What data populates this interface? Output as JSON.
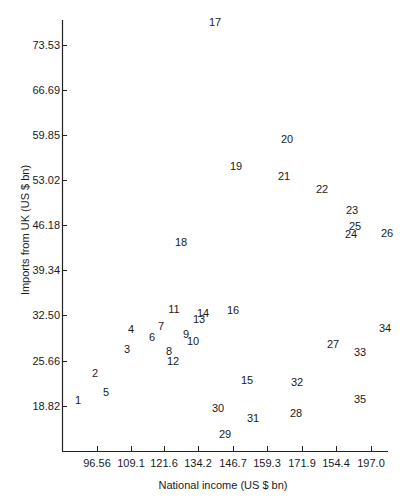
{
  "chart_data": {
    "type": "scatter",
    "title": "",
    "xlabel": "National income (US $ bn)",
    "ylabel": "Imports from UK (US $ bn)",
    "x_ticks": [
      "96.56",
      "109.1",
      "121.6",
      "134.2",
      "146.7",
      "159.3",
      "171.9",
      "154.4",
      "197.0"
    ],
    "y_ticks": [
      "73.53",
      "66.69",
      "59.85",
      "53.02",
      "46.18",
      "39.34",
      "32.50",
      "25.66",
      "18.82"
    ],
    "xlim": [
      84,
      200
    ],
    "ylim": [
      12,
      77
    ],
    "grid": false,
    "legend": "none",
    "marker": "numeric label",
    "points": [
      {
        "label": "1",
        "x": 87.5,
        "y": 19.6,
        "px": 78,
        "py": 400
      },
      {
        "label": "2",
        "x": 95.5,
        "y": 24.1,
        "px": 95,
        "py": 373
      },
      {
        "label": "3",
        "x": 106.5,
        "y": 28.1,
        "px": 127,
        "py": 349
      },
      {
        "label": "4",
        "x": 110.3,
        "y": 31.2,
        "px": 131,
        "py": 329
      },
      {
        "label": "5",
        "x": 100.5,
        "y": 21.5,
        "px": 106,
        "py": 392
      },
      {
        "label": "6",
        "x": 117.0,
        "y": 29.4,
        "px": 152,
        "py": 337
      },
      {
        "label": "7",
        "x": 120.5,
        "y": 31.4,
        "px": 161,
        "py": 326
      },
      {
        "label": "8",
        "x": 123.5,
        "y": 27.8,
        "px": 169,
        "py": 351
      },
      {
        "label": "9",
        "x": 129.5,
        "y": 30.0,
        "px": 186,
        "py": 334
      },
      {
        "label": "10",
        "x": 131.0,
        "y": 29.0,
        "px": 193,
        "py": 341
      },
      {
        "label": "11",
        "x": 124.5,
        "y": 34.0,
        "px": 174,
        "py": 309
      },
      {
        "label": "12",
        "x": 124.5,
        "y": 26.2,
        "px": 173,
        "py": 361
      },
      {
        "label": "13",
        "x": 133.0,
        "y": 32.4,
        "px": 199,
        "py": 319
      },
      {
        "label": "14",
        "x": 134.0,
        "y": 33.2,
        "px": 203,
        "py": 313
      },
      {
        "label": "15",
        "x": 146.5,
        "y": 23.0,
        "px": 247,
        "py": 380
      },
      {
        "label": "16",
        "x": 143.0,
        "y": 33.4,
        "px": 233,
        "py": 310
      },
      {
        "label": "17",
        "x": 136.0,
        "y": 76.9,
        "px": 215,
        "py": 22
      },
      {
        "label": "18",
        "x": 126.5,
        "y": 44.4,
        "px": 181,
        "py": 242
      },
      {
        "label": "19",
        "x": 141.0,
        "y": 55.7,
        "px": 236,
        "py": 166
      },
      {
        "label": "20",
        "x": 160.5,
        "y": 59.3,
        "px": 287,
        "py": 139
      },
      {
        "label": "21",
        "x": 160.0,
        "y": 53.3,
        "px": 284,
        "py": 176
      },
      {
        "label": "22",
        "x": 173.0,
        "y": 51.7,
        "px": 322,
        "py": 189
      },
      {
        "label": "23",
        "x": 182.5,
        "y": 47.4,
        "px": 352,
        "py": 210
      },
      {
        "label": "24",
        "x": 182.0,
        "y": 45.6,
        "px": 351,
        "py": 234
      },
      {
        "label": "25",
        "x": 183.5,
        "y": 46.7,
        "px": 355,
        "py": 226
      },
      {
        "label": "26",
        "x": 196.5,
        "y": 45.4,
        "px": 387,
        "py": 233
      },
      {
        "label": "27",
        "x": 175.5,
        "y": 27.6,
        "px": 333,
        "py": 344
      },
      {
        "label": "28",
        "x": 166.5,
        "y": 17.7,
        "px": 296,
        "py": 413
      },
      {
        "label": "29",
        "x": 137.0,
        "y": 14.2,
        "px": 225,
        "py": 434
      },
      {
        "label": "30",
        "x": 134.0,
        "y": 18.5,
        "px": 218,
        "py": 408
      },
      {
        "label": "31",
        "x": 146.5,
        "y": 16.7,
        "px": 253,
        "py": 418
      },
      {
        "label": "32",
        "x": 166.5,
        "y": 22.6,
        "px": 297,
        "py": 382
      },
      {
        "label": "33",
        "x": 184.0,
        "y": 27.0,
        "px": 360,
        "py": 352
      },
      {
        "label": "34",
        "x": 197.0,
        "y": 31.2,
        "px": 385,
        "py": 328
      },
      {
        "label": "35",
        "x": 184.0,
        "y": 20.0,
        "px": 360,
        "py": 399
      }
    ]
  }
}
